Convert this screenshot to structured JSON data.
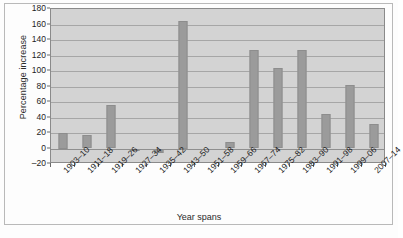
{
  "chart_data": {
    "type": "bar",
    "title": "",
    "xlabel": "Year spans",
    "ylabel": "Percentage increase",
    "ylim": [
      -20,
      180
    ],
    "ytick_step": 20,
    "yticks": [
      180,
      160,
      140,
      120,
      100,
      80,
      60,
      40,
      20,
      0,
      -20
    ],
    "ytick_labels": [
      "180",
      "160",
      "140",
      "120",
      "100",
      "80",
      "60",
      "40",
      "20",
      "0",
      "–20"
    ],
    "grid": true,
    "legend": false,
    "categories": [
      "1903–10",
      "1911–18",
      "1919–26",
      "1927–34",
      "1935–42",
      "1943–50",
      "1951–58",
      "1959–66",
      "1967–74",
      "1975–82",
      "1983–90",
      "1991–98",
      "1999–06",
      "2007–14"
    ],
    "values": [
      20,
      18,
      56,
      -2,
      -6,
      165,
      0,
      9,
      127,
      104,
      127,
      44,
      82,
      31
    ],
    "colors": {
      "bar": "#9b9b9b",
      "bar_edge": "#8d8d8d",
      "plot_background": "#d3d3d3",
      "gridline": "#a6a6a6",
      "axis": "#8a8a8a",
      "frame": "#b9b9b9",
      "text": "#1d1d1d",
      "page_background": "#fdfdfd"
    }
  }
}
